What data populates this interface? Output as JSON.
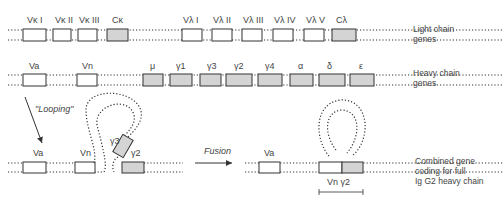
{
  "light_chain": {
    "segments": [
      "Vκ I",
      "Vκ II",
      "Vκ III",
      "Cκ",
      "Vλ I",
      "Vλ II",
      "Vλ III",
      "Vλ IV",
      "Vλ V",
      "Cλ"
    ],
    "caption": "Light chain\ngenes"
  },
  "heavy_chain": {
    "segments": [
      "Va",
      "Vn",
      "μ",
      "γ1",
      "γ3",
      "γ2",
      "γ4",
      "α",
      "δ",
      "ε"
    ],
    "caption": "Heavy chain\ngenes"
  },
  "looping": {
    "label": "\"Looping\"",
    "segments": [
      "Va",
      "Vn",
      "γ3",
      "γ2"
    ]
  },
  "fusion": {
    "label": "Fusion",
    "segments": [
      "Va"
    ],
    "combined_label": "Vn γ2",
    "caption": "Combined gene\ncoding for full\nIg G2 heavy chain"
  },
  "colors": {
    "line": "#333333",
    "box_fill_variable": "#ffffff",
    "box_fill_constant": "#d4d4d4"
  }
}
